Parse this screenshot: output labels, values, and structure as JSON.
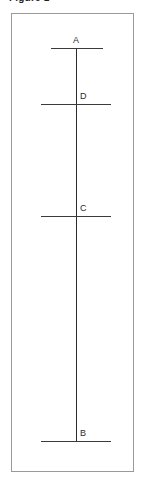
{
  "figure": {
    "title": "Figure 1",
    "frame": {
      "border_color": "#9a9a9a",
      "background_color": "#ffffff"
    },
    "colors": {
      "line": "#2b2b2b",
      "tick": "#3a3a3a",
      "label": "#2b2b2b",
      "frame": "#9a9a9a"
    }
  },
  "diagram": {
    "type": "line-with-labeled-points",
    "vertical_line": {
      "name": "main-vertical-line",
      "x": 64,
      "y_top": 34,
      "y_bottom": 427
    },
    "ticks": [
      {
        "name": "tick-a",
        "label": "A",
        "x_start": 39,
        "x_end": 91,
        "y": 34
      },
      {
        "name": "tick-d",
        "label": "D",
        "x_start": 29,
        "x_end": 99,
        "y": 90
      },
      {
        "name": "tick-c",
        "label": "C",
        "x_start": 29,
        "x_end": 99,
        "y": 202
      },
      {
        "name": "tick-b",
        "label": "B",
        "x_start": 29,
        "x_end": 99,
        "y": 427
      }
    ],
    "labels": [
      {
        "name": "label-a",
        "text": "A",
        "x": 64,
        "y": 22,
        "align": "center"
      },
      {
        "name": "label-d",
        "text": "D",
        "x": 68,
        "y": 78,
        "align": "left"
      },
      {
        "name": "label-c",
        "text": "C",
        "x": 68,
        "y": 190,
        "align": "left"
      },
      {
        "name": "label-b",
        "text": "B",
        "x": 68,
        "y": 415,
        "align": "left"
      }
    ]
  }
}
